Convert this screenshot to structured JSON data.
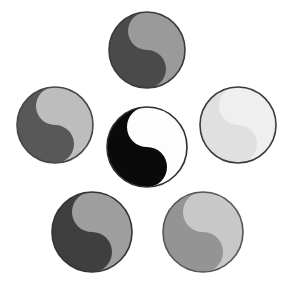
{
  "figure": {
    "background_color": "#ffffff",
    "width": 293,
    "height": 285,
    "symbol_count": 6,
    "outline_color": "#3b3b3b",
    "outline_width": 1.6
  },
  "symbols": [
    {
      "id": "center",
      "name": "center-yin-yang",
      "position_label": "center",
      "cx": 147,
      "cy": 147,
      "r": 40,
      "dark_color": "#0a0a0a",
      "light_color": "#fdfdfd",
      "outline_color": "#2e2e2e",
      "contrast_label": "high"
    },
    {
      "id": "top",
      "name": "top-yin-yang",
      "position_label": "top",
      "cx": 147,
      "cy": 50,
      "r": 38,
      "dark_color": "#4a4a4a",
      "light_color": "#9a9a9a",
      "outline_color": "#3b3b3b",
      "contrast_label": "medium"
    },
    {
      "id": "left",
      "name": "left-yin-yang",
      "position_label": "left",
      "cx": 55,
      "cy": 125,
      "r": 38,
      "dark_color": "#585858",
      "light_color": "#bdbdbd",
      "outline_color": "#474747",
      "contrast_label": "medium"
    },
    {
      "id": "right",
      "name": "right-yin-yang",
      "position_label": "right",
      "cx": 238,
      "cy": 125,
      "r": 38,
      "dark_color": "#e0e0e0",
      "light_color": "#efefef",
      "outline_color": "#3b3b3b",
      "contrast_label": "very-low"
    },
    {
      "id": "bottom-left",
      "name": "bottom-left-yin-yang",
      "position_label": "bottom-left",
      "cx": 92,
      "cy": 232,
      "r": 40,
      "dark_color": "#3f3f3f",
      "light_color": "#9e9e9e",
      "outline_color": "#333333",
      "contrast_label": "medium"
    },
    {
      "id": "bottom-right",
      "name": "bottom-right-yin-yang",
      "position_label": "bottom-right",
      "cx": 203,
      "cy": 232,
      "r": 40,
      "dark_color": "#949494",
      "light_color": "#c8c8c8",
      "outline_color": "#555555",
      "contrast_label": "low"
    }
  ]
}
